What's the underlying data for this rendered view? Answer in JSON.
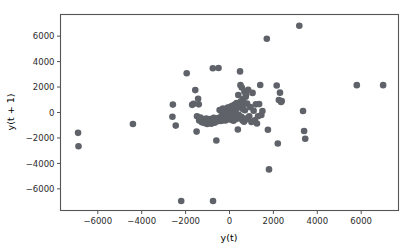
{
  "chart_data": {
    "type": "scatter",
    "title": "",
    "xlabel": "y(t)",
    "ylabel": "y(t + 1)",
    "xlim": [
      -7700,
      7700
    ],
    "ylim": [
      -7700,
      7700
    ],
    "xticks": [
      -6000,
      -4000,
      -2000,
      0,
      2000,
      4000,
      6000
    ],
    "xticklabels": [
      "−6000",
      "−4000",
      "−2000",
      "0",
      "2000",
      "4000",
      "6000"
    ],
    "yticks": [
      -6000,
      -4000,
      -2000,
      0,
      2000,
      4000,
      6000
    ],
    "yticklabels": [
      "−6000",
      "−4000",
      "−2000",
      "0",
      "2000",
      "4000",
      "6000"
    ],
    "grid": false,
    "legend": null,
    "marker": "circle",
    "marker_color": "#5f6369",
    "marker_size": 4.2,
    "series": [
      {
        "name": "lag-1 scatter",
        "points": [
          [
            -6900,
            -1600
          ],
          [
            -6880,
            -2650
          ],
          [
            -4400,
            -900
          ],
          [
            -2600,
            -330
          ],
          [
            -2580,
            620
          ],
          [
            -2450,
            -1030
          ],
          [
            -2200,
            -6950
          ],
          [
            -1950,
            3080
          ],
          [
            -1700,
            600
          ],
          [
            -1640,
            680
          ],
          [
            -1560,
            1760
          ],
          [
            -1500,
            -1500
          ],
          [
            -1480,
            -300
          ],
          [
            -1430,
            1080
          ],
          [
            -1400,
            640
          ],
          [
            -1380,
            -620
          ],
          [
            -1320,
            -400
          ],
          [
            -1260,
            -760
          ],
          [
            -1230,
            -560
          ],
          [
            -1200,
            -700
          ],
          [
            -1150,
            -820
          ],
          [
            -1100,
            -640
          ],
          [
            -1060,
            -480
          ],
          [
            -1020,
            -900
          ],
          [
            -980,
            -600
          ],
          [
            -940,
            -700
          ],
          [
            -900,
            -520
          ],
          [
            -860,
            -760
          ],
          [
            -830,
            -880
          ],
          [
            -800,
            -660
          ],
          [
            -760,
            3480
          ],
          [
            -750,
            -6950
          ],
          [
            -720,
            -420
          ],
          [
            -700,
            -600
          ],
          [
            -680,
            -800
          ],
          [
            -640,
            -540
          ],
          [
            -600,
            -2200
          ],
          [
            -580,
            -700
          ],
          [
            -560,
            -460
          ],
          [
            -540,
            -620
          ],
          [
            -500,
            3500
          ],
          [
            -480,
            -560
          ],
          [
            -450,
            200
          ],
          [
            -430,
            -380
          ],
          [
            -400,
            -660
          ],
          [
            -380,
            120
          ],
          [
            -360,
            -500
          ],
          [
            -340,
            -300
          ],
          [
            -320,
            -620
          ],
          [
            -300,
            320
          ],
          [
            -280,
            -440
          ],
          [
            -260,
            -180
          ],
          [
            -240,
            -560
          ],
          [
            -220,
            60
          ],
          [
            -200,
            -340
          ],
          [
            -180,
            -620
          ],
          [
            -160,
            260
          ],
          [
            -140,
            -420
          ],
          [
            -120,
            -140
          ],
          [
            -100,
            -520
          ],
          [
            -80,
            380
          ],
          [
            -60,
            -260
          ],
          [
            -40,
            -480
          ],
          [
            -20,
            140
          ],
          [
            0,
            -380
          ],
          [
            20,
            420
          ],
          [
            40,
            -200
          ],
          [
            60,
            -560
          ],
          [
            80,
            260
          ],
          [
            100,
            -320
          ],
          [
            120,
            520
          ],
          [
            140,
            -420
          ],
          [
            160,
            40
          ],
          [
            180,
            -640
          ],
          [
            200,
            300
          ],
          [
            220,
            -260
          ],
          [
            240,
            620
          ],
          [
            260,
            -400
          ],
          [
            280,
            160
          ],
          [
            300,
            -520
          ],
          [
            320,
            740
          ],
          [
            340,
            -300
          ],
          [
            360,
            420
          ],
          [
            380,
            -1340
          ],
          [
            400,
            1380
          ],
          [
            420,
            -180
          ],
          [
            440,
            560
          ],
          [
            460,
            -460
          ],
          [
            480,
            3230
          ],
          [
            500,
            2150
          ],
          [
            520,
            880
          ],
          [
            540,
            -340
          ],
          [
            560,
            1960
          ],
          [
            580,
            300
          ],
          [
            600,
            -620
          ],
          [
            620,
            1060
          ],
          [
            640,
            640
          ],
          [
            660,
            -720
          ],
          [
            680,
            1640
          ],
          [
            700,
            180
          ],
          [
            720,
            -480
          ],
          [
            740,
            1240
          ],
          [
            760,
            1420
          ],
          [
            780,
            -540
          ],
          [
            800,
            700
          ],
          [
            850,
            1780
          ],
          [
            900,
            -300
          ],
          [
            950,
            420
          ],
          [
            1000,
            -740
          ],
          [
            1050,
            1540
          ],
          [
            1100,
            140
          ],
          [
            1150,
            -620
          ],
          [
            1200,
            640
          ],
          [
            1250,
            -860
          ],
          [
            1300,
            -300
          ],
          [
            1350,
            660
          ],
          [
            1400,
            2160
          ],
          [
            1450,
            -200
          ],
          [
            1500,
            120
          ],
          [
            1700,
            5800
          ],
          [
            1750,
            -1360
          ],
          [
            1800,
            -4470
          ],
          [
            2150,
            2120
          ],
          [
            2200,
            -2440
          ],
          [
            2250,
            980
          ],
          [
            2300,
            1560
          ],
          [
            2350,
            820
          ],
          [
            2380,
            900
          ],
          [
            3180,
            6820
          ],
          [
            3350,
            120
          ],
          [
            3400,
            -1450
          ],
          [
            3450,
            -2060
          ],
          [
            5800,
            2150
          ],
          [
            7000,
            2150
          ]
        ]
      }
    ]
  },
  "figure": {
    "background_color": "#ffffff",
    "axes_color": "#555555",
    "text_color": "#2b2b2b"
  }
}
